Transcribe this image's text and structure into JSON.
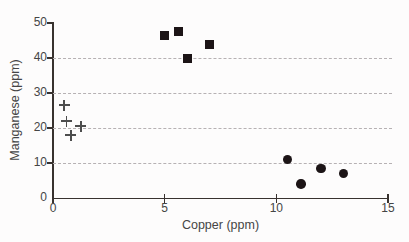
{
  "chart_data": {
    "type": "scatter",
    "title": "",
    "xlabel": "Copper (ppm)",
    "ylabel": "Manganese (ppm)",
    "xlim": [
      0,
      15
    ],
    "ylim": [
      0,
      50
    ],
    "x_ticks": [
      0,
      5,
      10,
      15
    ],
    "y_ticks": [
      0,
      10,
      20,
      30,
      40,
      50
    ],
    "gridlines_y": [
      10,
      20,
      30,
      40
    ],
    "grid_style": "dashed",
    "legend": "none",
    "series": [
      {
        "name": "plus-markers-low-copper",
        "marker": "plus",
        "color": "#4d4d4d",
        "points": [
          [
            0.5,
            26.5
          ],
          [
            0.6,
            22
          ],
          [
            0.8,
            18
          ],
          [
            1.25,
            20.5
          ]
        ]
      },
      {
        "name": "square-markers-mid-copper",
        "marker": "square",
        "color": "#1c1416",
        "points": [
          [
            5.0,
            46.5
          ],
          [
            5.6,
            47.5
          ],
          [
            6.0,
            40.0
          ],
          [
            7.0,
            44.0
          ]
        ]
      },
      {
        "name": "circle-markers-high-copper",
        "marker": "circle",
        "color": "#1c1416",
        "points": [
          [
            10.5,
            11
          ],
          [
            11.1,
            4
          ],
          [
            12.0,
            8.5
          ],
          [
            13.0,
            7
          ]
        ]
      }
    ]
  },
  "colors": {
    "background": "#fdfcfc",
    "axis": "#38322f",
    "grid": "#b6b1b3",
    "text": "#454545",
    "marker_dark": "#1c1416",
    "marker_plus": "#4d4d4d"
  }
}
